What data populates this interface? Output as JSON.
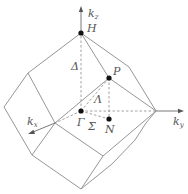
{
  "diagram": {
    "axes": {
      "kz": {
        "label": "k",
        "subscript": "z"
      },
      "ky": {
        "label": "k",
        "subscript": "y"
      },
      "kx": {
        "label": "k",
        "subscript": "x"
      }
    },
    "points": {
      "H": {
        "label": "H"
      },
      "P": {
        "label": "P"
      },
      "Gamma": {
        "label": "Γ"
      },
      "N": {
        "label": "N"
      }
    },
    "lines": {
      "Delta": {
        "label": "Δ"
      },
      "Lambda": {
        "label": "Λ"
      },
      "Sigma": {
        "label": "Σ"
      }
    },
    "colors": {
      "edges": "#8a8a8a",
      "axes": "#6a6a6a",
      "points": "#111111",
      "labels": "#555555"
    }
  }
}
